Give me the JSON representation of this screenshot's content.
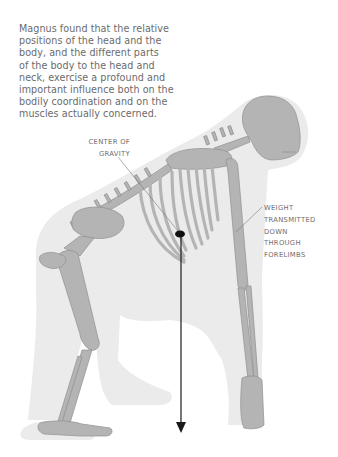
{
  "intro_text": "Magnus found that the relative positions of the head and the body, and the different parts of the body to the head and neck, exercise a profound and important influence both on the bodily coordination and on the muscles actually concerned.",
  "intro_lines": [
    "Magnus found that the relative",
    "positions of the head and the",
    "body, and the different parts",
    "of the body to the head and",
    "neck, exercise a profound and",
    "important influence both on the",
    "bodily coordination and on the",
    "muscles actually concerned."
  ],
  "figure": {
    "labels": {
      "center_of_gravity": [
        "CENTER OF",
        "GRAVITY"
      ],
      "weight_transmitted": [
        "WEIGHT",
        "TRANSMITTED",
        "DOWN",
        "THROUGH",
        "FORELIMBS"
      ]
    },
    "colors": {
      "silhouette": "#e9e9e9",
      "bone": "#b4b4b4",
      "bone_outline": "#8f8f8f",
      "arrow": "#1a1a1a",
      "label_text": "#6e6e6e",
      "body_text": "#6b6b6b"
    }
  }
}
